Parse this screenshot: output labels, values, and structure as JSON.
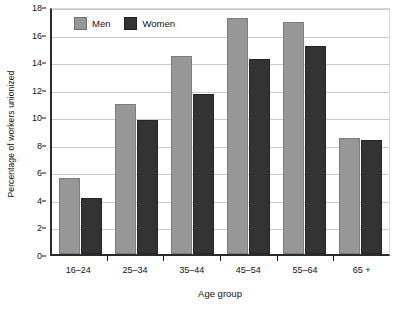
{
  "chart_data": {
    "type": "bar",
    "title": "",
    "xlabel": "Age group",
    "ylabel": "Percentage of workers unionized",
    "categories": [
      "16–24",
      "25–34",
      "35–44",
      "45–54",
      "55–64",
      "65 +"
    ],
    "series": [
      {
        "name": "Men",
        "color": "#979797",
        "values": [
          5.5,
          10.9,
          14.35,
          17.1,
          16.85,
          8.4
        ]
      },
      {
        "name": "Women",
        "color": "#333333",
        "values": [
          4.1,
          9.75,
          11.6,
          14.15,
          15.1,
          8.3
        ]
      }
    ],
    "ylim": [
      0,
      18
    ],
    "ytick_values": [
      0,
      2,
      4,
      6,
      8,
      10,
      12,
      14,
      16,
      18
    ],
    "ytick_labels": [
      "0",
      "2",
      "4",
      "6",
      "8",
      "10",
      "12",
      "14",
      "16",
      "18"
    ],
    "grid": true,
    "grid_axis": "y",
    "legend_position": "top-left-inside",
    "legend_entries": [
      "Men",
      "Women"
    ]
  },
  "axes": {
    "y_title": "Percentage of workers unionized",
    "x_title": "Age group"
  },
  "legend": {
    "men_label": "Men",
    "women_label": "Women"
  }
}
